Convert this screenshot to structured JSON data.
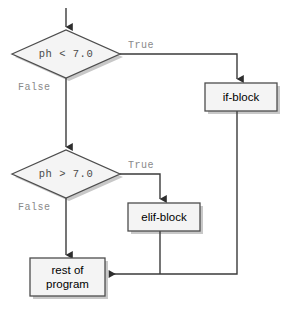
{
  "diagram": {
    "type": "flowchart",
    "background_color": "#ffffff",
    "line_color": "#3b3b3b",
    "node_fill": "#f2f2f2",
    "node_stroke": "#4d4d4d",
    "shadow_color": "#bdbdbd",
    "condition_text_color": "#4a4a4a",
    "edge_label_color": "#8a8a8a",
    "node_text_color": "#000000"
  },
  "nodes": {
    "entry_arrow": {
      "name": "entry"
    },
    "decision_1": {
      "shape": "diamond",
      "text": "ph < 7.0"
    },
    "decision_2": {
      "shape": "diamond",
      "text": "ph > 7.0"
    },
    "if_block": {
      "shape": "rect",
      "text": "if-block"
    },
    "elif_block": {
      "shape": "rect",
      "text": "elif-block"
    },
    "rest_of_program": {
      "shape": "rect",
      "line1": "rest of",
      "line2": "program"
    }
  },
  "edges": {
    "d1_true": {
      "label": "True",
      "from": "decision_1",
      "to": "if_block"
    },
    "d1_false": {
      "label": "False",
      "from": "decision_1",
      "to": "decision_2"
    },
    "d2_true": {
      "label": "True",
      "from": "decision_2",
      "to": "elif_block"
    },
    "d2_false": {
      "label": "False",
      "from": "decision_2",
      "to": "rest_of_program"
    },
    "if_merge": {
      "label": "",
      "from": "if_block",
      "to": "rest_of_program"
    },
    "elif_merge": {
      "label": "",
      "from": "elif_block",
      "to": "rest_of_program"
    }
  }
}
